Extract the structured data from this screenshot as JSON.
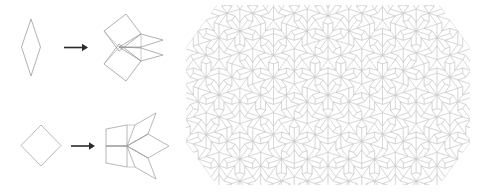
{
  "figure": {
    "background_color": "#ffffff",
    "width": 487,
    "height": 193
  },
  "style": {
    "tile_stroke_color": "#8c8c8c",
    "tile_stroke_color_light": "#b8b8b8",
    "tiling_stroke_color": "#bdbdbd",
    "tiling_stroke_color_faint": "#d6d6d6",
    "arrow_color": "#2b2b2b",
    "tile_fill": "none",
    "tile_stroke_width": 0.6,
    "tiling_stroke_width": 0.45
  },
  "substitution_panel": {
    "name": "substitution-rules",
    "rows": [
      {
        "id": "thin-rhomb-rule",
        "label": "thin rhombus substitution",
        "source": {
          "name": "thin-rhombus",
          "shape": "rhombus",
          "acute_angle_deg": 36,
          "obtuse_angle_deg": 144,
          "points": "31,19 40,47 31,76 22,47"
        },
        "arrow": {
          "name": "substitution-arrow-thin",
          "glyph": "right-arrow",
          "x1": 64,
          "y1": 47,
          "x2": 86,
          "y2": 47
        },
        "result": {
          "name": "thin-rhombus-decomposition",
          "tile_count": 4,
          "description": "one thin rhombus replaced by two fat and two thin rhombs"
        }
      },
      {
        "id": "fat-rhomb-rule",
        "label": "fat rhombus substitution",
        "source": {
          "name": "fat-rhombus",
          "shape": "rhombus",
          "acute_angle_deg": 72,
          "obtuse_angle_deg": 108,
          "points": "41,124 62,145 41,166 20,145"
        },
        "arrow": {
          "name": "substitution-arrow-fat",
          "glyph": "right-arrow",
          "x1": 71,
          "y1": 146,
          "x2": 93,
          "y2": 146
        },
        "result": {
          "name": "fat-rhombus-decomposition",
          "tile_count": 5,
          "description": "one fat rhombus replaced by three fat and two thin rhombs"
        }
      }
    ]
  },
  "tiling_panel": {
    "name": "penrose-tiling-patch",
    "label": "Penrose P3 rhombus tiling patch",
    "bounds": {
      "x": 186,
      "y": 5,
      "width": 284,
      "height": 180
    },
    "tile_types": [
      "fat rhombus (72/108)",
      "thin rhombus (36/144)"
    ],
    "symmetry": "fivefold aperiodic"
  }
}
